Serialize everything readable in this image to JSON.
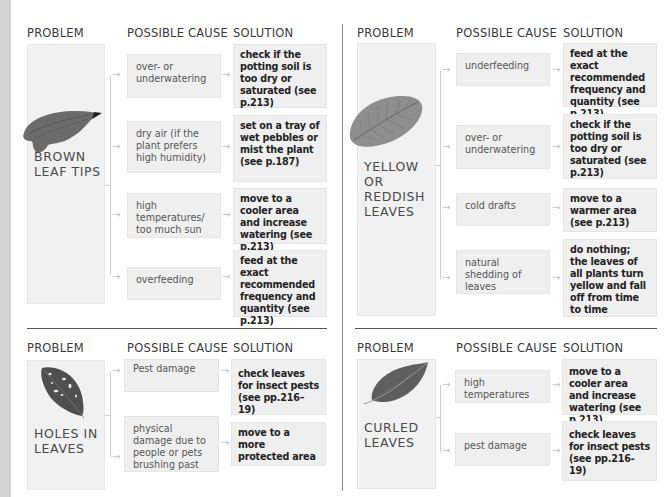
{
  "headers": {
    "problem": "PROBLEM",
    "cause": "POSSIBLE CAUSE",
    "solution": "SOLUTION"
  },
  "panels": [
    {
      "id": "brown-leaf-tips",
      "problem": "BROWN\nLEAF TIPS",
      "problem_lines": [
        "BROWN",
        "LEAF TIPS"
      ],
      "leaf_icon": "curled-brown-leaf-icon",
      "rows": [
        {
          "cause": "over- or underwatering",
          "solution": "check if the potting soil is too dry or saturated (see p.213)"
        },
        {
          "cause": "dry air (if the plant prefers high humidity)",
          "solution": "set on a tray of wet pebbles or mist the plant (see p.187)"
        },
        {
          "cause": "high temperatures/ too much sun",
          "solution": "move to a cooler area and increase watering (see p.213)"
        },
        {
          "cause": "overfeeding",
          "solution": "feed at the exact recommended frequency and quantity (see p.213)"
        }
      ]
    },
    {
      "id": "yellow-or-reddish-leaves",
      "problem_lines": [
        "YELLOW",
        "OR",
        "REDDISH",
        "LEAVES"
      ],
      "leaf_icon": "textured-yellow-leaf-icon",
      "rows": [
        {
          "cause": "underfeeding",
          "solution": "feed at the exact recommended frequency and quantity (see p.213)"
        },
        {
          "cause": "over- or underwatering",
          "solution": "check if the potting soil is too dry or saturated (see p.213)"
        },
        {
          "cause": "cold drafts",
          "solution": "move to a warmer area (see p.213)"
        },
        {
          "cause": "natural shedding of leaves",
          "solution": "do nothing; the leaves of all plants turn yellow and fall off from time to time"
        }
      ]
    },
    {
      "id": "holes-in-leaves",
      "problem_lines": [
        "HOLES IN",
        "LEAVES"
      ],
      "leaf_icon": "holed-leaf-icon",
      "rows": [
        {
          "cause": "Pest damage",
          "solution": "check leaves for insect pests (see pp.216–19)"
        },
        {
          "cause": "physical damage due to people or pets brushing past",
          "solution": "move to a more protected area"
        }
      ]
    },
    {
      "id": "curled-leaves",
      "problem_lines": [
        "CURLED",
        "LEAVES"
      ],
      "leaf_icon": "curled-leaf-icon",
      "rows": [
        {
          "cause": "high temperatures",
          "solution": "move to a cooler area and increase watering (see p.213)"
        },
        {
          "cause": "pest damage",
          "solution": "check leaves for insect pests (see pp.216-19)"
        }
      ]
    }
  ],
  "arrow_glyph": "→"
}
